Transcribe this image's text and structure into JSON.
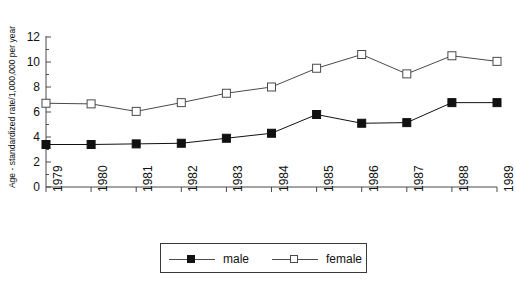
{
  "chart_data": {
    "type": "line",
    "title": "",
    "xlabel": "",
    "ylabel": "Age - standardized rate/1,000,000 per year",
    "categories": [
      "1979",
      "1980",
      "1981",
      "1982",
      "1983",
      "1984",
      "1985",
      "1986",
      "1987",
      "1988",
      "1989"
    ],
    "ylim": [
      0,
      12
    ],
    "yticks": [
      0,
      2,
      4,
      6,
      8,
      10,
      12
    ],
    "grid": false,
    "legend_position": "bottom",
    "series": [
      {
        "name": "male",
        "marker": "filled-square",
        "color": "#111111",
        "values": [
          3.4,
          3.4,
          3.45,
          3.5,
          3.9,
          4.3,
          5.8,
          5.1,
          5.15,
          6.75,
          6.75
        ]
      },
      {
        "name": "female",
        "marker": "open-square",
        "color": "#4a4a4a",
        "values": [
          6.7,
          6.65,
          6.05,
          6.75,
          7.5,
          8.0,
          9.5,
          10.6,
          9.05,
          10.5,
          10.05
        ]
      }
    ]
  },
  "axes": {
    "y_title": "Age - standardized rate/1,000,000 per year",
    "y_tick_labels": [
      "12",
      "10",
      "8",
      "6",
      "4",
      "2",
      "0"
    ],
    "x_tick_labels": [
      "1979",
      "1980",
      "1981",
      "1982",
      "1983",
      "1984",
      "1985",
      "1986",
      "1987",
      "1988",
      "1989"
    ]
  },
  "legend": {
    "items": [
      {
        "label": "male",
        "marker": "filled-square"
      },
      {
        "label": "female",
        "marker": "open-square"
      }
    ]
  },
  "title": {
    "text": ""
  },
  "colors": {
    "axis": "#4a4a4a",
    "male": "#111111",
    "female": "#4a4a4a",
    "background": "#ffffff"
  }
}
